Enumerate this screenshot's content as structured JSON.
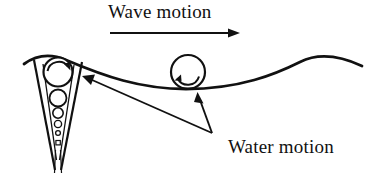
{
  "figure": {
    "background_color": "#ffffff",
    "ink_color": "#111111"
  },
  "labels": {
    "wave_motion": "Wave motion",
    "water_motion": "Water motion"
  },
  "icons": {
    "wave_direction_arrow": "arrow-right-icon",
    "left_vortex_rotation_arrow": "clockwise-arc-arrow-icon",
    "right_circle_rotation_arrow": "clockwise-arc-arrow-icon",
    "pointer_to_breaking_wave": "arrow-pointer-icon",
    "pointer_to_orbital_circle": "arrow-pointer-icon"
  },
  "diagram": {
    "wave_surface": {
      "name": "wave-surface-curve",
      "path": "M 24 64 C 38 54, 52 54, 66 60 C 104 76, 140 89, 186 89 C 240 89, 276 74, 300 62 C 316 54, 336 54, 362 66",
      "stroke_width": 2.6
    },
    "wave_arrow": {
      "name": "wave-direction-arrow",
      "x1": 110,
      "y1": 33,
      "x2": 238,
      "y2": 33,
      "stroke_width": 1.8,
      "head_length": 11,
      "head_width": 7
    },
    "left_vortex": {
      "name": "left-vortex-cone",
      "cone_outer": "M 34 60 L 56 168 L 60 168 L 82 62",
      "cone_inner": "M 41 63 L 57 162 L 59 162 L 76 64",
      "tail_lines": [
        {
          "x1": 56,
          "y1": 150,
          "x2": 55,
          "y2": 172
        },
        {
          "x1": 60,
          "y1": 150,
          "x2": 61,
          "y2": 172
        }
      ],
      "circles": [
        {
          "cx": 58,
          "cy": 72,
          "r": 14.5
        },
        {
          "cx": 58,
          "cy": 98,
          "r": 8.5
        },
        {
          "cx": 58,
          "cy": 113,
          "r": 5.2
        },
        {
          "cx": 58,
          "cy": 124,
          "r": 3.6
        },
        {
          "cx": 58,
          "cy": 133,
          "r": 2.4
        }
      ],
      "terminal_square": {
        "x": 56,
        "y": 141,
        "w": 4.4,
        "h": 4.4
      },
      "rotation_arc": {
        "path": "M 47 70 A 12 12 0 0 1 68 66",
        "arrow_tip_x": 70,
        "arrow_tip_y": 69
      }
    },
    "right_orbit": {
      "name": "right-orbital-circle",
      "circle": {
        "cx": 188,
        "cy": 72,
        "r": 17
      },
      "rotation_arc": {
        "path": "M 177 80 A 12 12 0 0 0 199 78",
        "arrow_tip_x": 176,
        "arrow_tip_y": 83
      }
    },
    "callouts": {
      "origin": {
        "x": 212,
        "y": 133
      },
      "to_left_vortex": {
        "tip_x": 83,
        "tip_y": 77
      },
      "to_right_circle": {
        "tip_x": 198,
        "tip_y": 93
      },
      "stroke_width": 1.8
    }
  }
}
